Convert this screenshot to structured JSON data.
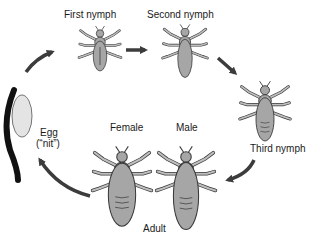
{
  "stages": {
    "egg": {
      "label": "Egg",
      "sublabel": "(“nit”)"
    },
    "first_nymph": {
      "label": "First nymph"
    },
    "second_nymph": {
      "label": "Second nymph"
    },
    "third_nymph": {
      "label": "Third nymph"
    },
    "female": {
      "label": "Female"
    },
    "male": {
      "label": "Male"
    },
    "adult": {
      "label": "Adult"
    }
  },
  "cycle_order": [
    "Egg",
    "First nymph",
    "Second nymph",
    "Third nymph",
    "Adult",
    "Egg"
  ],
  "colors": {
    "louse_fill": "#a6a6a6",
    "louse_stroke": "#3a3a3a",
    "arrow": "#3c3c3c",
    "hair": "#111111",
    "egg_fill": "#e4e4e4"
  }
}
